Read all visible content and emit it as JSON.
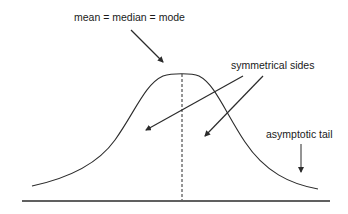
{
  "diagram": {
    "type": "normal-distribution-curve",
    "labels": {
      "center": "mean = median = mode",
      "sides": "symmetrical sides",
      "tail": "asymptotic tail"
    },
    "colors": {
      "stroke": "#2b2b2b",
      "text": "#1a1a1a",
      "background": "#ffffff"
    }
  }
}
